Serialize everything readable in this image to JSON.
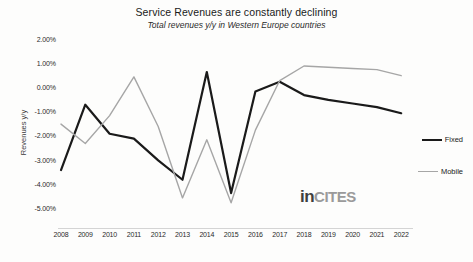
{
  "header": {
    "title": "Service Revenues are constantly declining",
    "subtitle": "Total revenues y/y in Western Europe countries"
  },
  "watermark": {
    "part1": "in",
    "part2": "CITES"
  },
  "legend": {
    "position": "right",
    "items": [
      {
        "label": "Fixed",
        "color": "#1a1a1a",
        "width": 2.2
      },
      {
        "label": "Mobile",
        "color": "#a6a6a6",
        "width": 1.4
      }
    ]
  },
  "chart_data": {
    "type": "line",
    "title": "Service Revenues are constantly declining",
    "subtitle": "Total revenues y/y in Western Europe countries",
    "xlabel": "",
    "ylabel": "Revenues y/y",
    "grid": false,
    "ylim": [
      -5.0,
      2.0
    ],
    "ytick_step": 1.0,
    "ytick_labels": [
      "2.00%",
      "1.00%",
      "0.00%",
      "-1.00%",
      "-2.00%",
      "-3.00%",
      "-4.00%",
      "-5.00%"
    ],
    "ytick_values": [
      2.0,
      1.0,
      0.0,
      -1.0,
      -2.0,
      -3.0,
      -4.0,
      -5.0
    ],
    "categories": [
      "2008",
      "2009",
      "2010",
      "2011",
      "2012",
      "2013",
      "2014",
      "2015",
      "2016",
      "2017",
      "2018",
      "2019",
      "2020",
      "2021",
      "2022"
    ],
    "series": [
      {
        "name": "Fixed",
        "color": "#1a1a1a",
        "values": [
          -3.35,
          -0.65,
          -1.85,
          -2.05,
          -2.95,
          -3.75,
          0.7,
          -4.3,
          -0.1,
          0.3,
          -0.25,
          -0.45,
          -0.6,
          -0.75,
          -1.0
        ]
      },
      {
        "name": "Mobile",
        "color": "#a6a6a6",
        "values": [
          -1.45,
          -2.25,
          -1.1,
          0.5,
          -1.55,
          -4.5,
          -2.1,
          -4.7,
          -1.7,
          0.35,
          0.95,
          0.9,
          0.85,
          0.8,
          0.55
        ]
      }
    ]
  }
}
